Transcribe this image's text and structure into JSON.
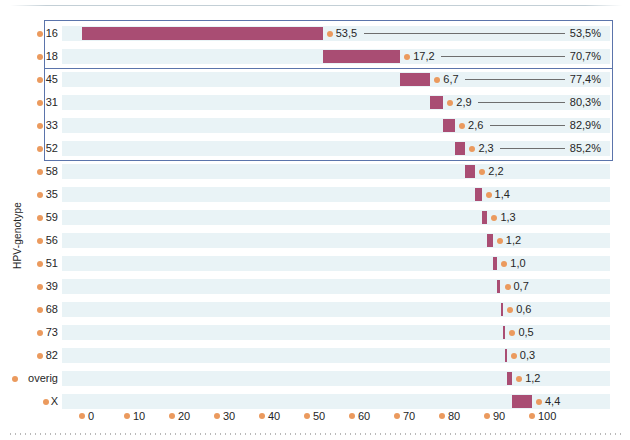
{
  "chart_data": {
    "type": "bar",
    "title": "",
    "subtitle": "",
    "xlabel": "",
    "ylabel": "HPV-genotype",
    "xlim": [
      0,
      100
    ],
    "grid": false,
    "legend_position": "none",
    "orientation": "horizontal",
    "note": "Horizontal bar chart of HPV genotype prevalence (%) with cumulative percentage leader lines; bars are positioned at their cumulative offset.",
    "xticks": [
      0,
      10,
      20,
      30,
      40,
      50,
      60,
      70,
      80,
      90,
      100
    ],
    "xtick_labels": [
      "0",
      "10",
      "20",
      "30",
      "40",
      "50",
      "60",
      "70",
      "80",
      "90",
      "100"
    ],
    "categories": [
      "16",
      "18",
      "45",
      "31",
      "33",
      "52",
      "58",
      "35",
      "59",
      "56",
      "51",
      "39",
      "68",
      "73",
      "82",
      "overig",
      "X"
    ],
    "values": [
      53.5,
      17.2,
      6.7,
      2.9,
      2.6,
      2.3,
      2.2,
      1.4,
      1.3,
      1.2,
      1.0,
      0.7,
      0.6,
      0.5,
      0.3,
      1.2,
      4.4
    ],
    "value_labels": [
      "53,5",
      "17,2",
      "6,7",
      "2,9",
      "2,6",
      "2,3",
      "2,2",
      "1,4",
      "1,3",
      "1,2",
      "1,0",
      "0,7",
      "0,6",
      "0,5",
      "0,3",
      "1,2",
      "4,4"
    ],
    "cumulative": [
      53.5,
      70.7,
      77.4,
      80.3,
      82.9,
      85.2,
      87.4,
      88.8,
      90.1,
      91.3,
      92.3,
      93.0,
      93.6,
      94.1,
      94.4,
      95.6,
      100.0
    ],
    "cumulative_labels": [
      "53,5%",
      "70,7%",
      "77,4%",
      "80,3%",
      "82,9%",
      "85,2%",
      "",
      "",
      "",
      "",
      "",
      "",
      "",
      "",
      "",
      "",
      ""
    ],
    "bar_start": [
      0.0,
      53.5,
      70.7,
      77.4,
      80.3,
      82.9,
      85.2,
      87.4,
      88.8,
      90.1,
      91.3,
      92.3,
      93.0,
      93.6,
      94.1,
      94.4,
      95.6
    ],
    "colors": {
      "bar": "#a94d73",
      "dot": "#eb9a5e",
      "stripe": "#e9f3f6",
      "highlight_box": "#5b74ab",
      "leader_line": "#6e6e6e",
      "text": "#262626",
      "background": "#ffffff"
    },
    "rows": [
      {
        "category": "16",
        "value_label": "53,5",
        "value": 53.5,
        "start": 0.0,
        "cumulative_label": "53,5%"
      },
      {
        "category": "18",
        "value_label": "17,2",
        "value": 17.2,
        "start": 53.5,
        "cumulative_label": "70,7%"
      },
      {
        "category": "45",
        "value_label": "6,7",
        "value": 6.7,
        "start": 70.7,
        "cumulative_label": "77,4%"
      },
      {
        "category": "31",
        "value_label": "2,9",
        "value": 2.9,
        "start": 77.4,
        "cumulative_label": "80,3%"
      },
      {
        "category": "33",
        "value_label": "2,6",
        "value": 2.6,
        "start": 80.3,
        "cumulative_label": "82,9%"
      },
      {
        "category": "52",
        "value_label": "2,3",
        "value": 2.3,
        "start": 82.9,
        "cumulative_label": "85,2%"
      },
      {
        "category": "58",
        "value_label": "2,2",
        "value": 2.2,
        "start": 85.2,
        "cumulative_label": ""
      },
      {
        "category": "35",
        "value_label": "1,4",
        "value": 1.4,
        "start": 87.4,
        "cumulative_label": ""
      },
      {
        "category": "59",
        "value_label": "1,3",
        "value": 1.3,
        "start": 88.8,
        "cumulative_label": ""
      },
      {
        "category": "56",
        "value_label": "1,2",
        "value": 1.2,
        "start": 90.1,
        "cumulative_label": ""
      },
      {
        "category": "51",
        "value_label": "1,0",
        "value": 1.0,
        "start": 91.3,
        "cumulative_label": ""
      },
      {
        "category": "39",
        "value_label": "0,7",
        "value": 0.7,
        "start": 92.3,
        "cumulative_label": ""
      },
      {
        "category": "68",
        "value_label": "0,6",
        "value": 0.6,
        "start": 93.0,
        "cumulative_label": ""
      },
      {
        "category": "73",
        "value_label": "0,5",
        "value": 0.5,
        "start": 93.6,
        "cumulative_label": ""
      },
      {
        "category": "82",
        "value_label": "0,3",
        "value": 0.3,
        "start": 94.1,
        "cumulative_label": ""
      },
      {
        "category": "overig",
        "value_label": "1,2",
        "value": 1.2,
        "start": 94.4,
        "cumulative_label": ""
      },
      {
        "category": "X",
        "value_label": "4,4",
        "value": 4.4,
        "start": 95.6,
        "cumulative_label": ""
      }
    ],
    "highlight_boxes": [
      {
        "label": "hpv-16-18-group",
        "first_row": 0,
        "last_row": 1
      },
      {
        "label": "hpv-nonavalent-group",
        "first_row": 0,
        "last_row": 5
      }
    ]
  }
}
